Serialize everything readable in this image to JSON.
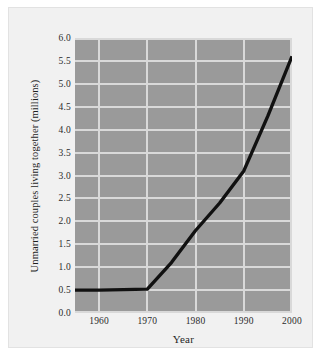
{
  "chart_data": {
    "type": "line",
    "title": "",
    "xlabel": "Year",
    "ylabel": "Unmarried couples living together (millions)",
    "xlim": [
      1955,
      2000
    ],
    "ylim": [
      0.0,
      6.0
    ],
    "grid": true,
    "legend": "none",
    "xticks": [
      1960,
      1970,
      1980,
      1990,
      2000
    ],
    "xtick_labels": [
      "1960",
      "1970",
      "1980",
      "1990",
      "2000"
    ],
    "yticks": [
      0.0,
      0.5,
      1.0,
      1.5,
      2.0,
      2.5,
      3.0,
      3.5,
      4.0,
      4.5,
      5.0,
      5.5,
      6.0
    ],
    "ytick_labels": [
      "0.0",
      "0.5",
      "1.0",
      "1.5",
      "2.0",
      "2.5",
      "3.0",
      "3.5",
      "4.0",
      "4.5",
      "5.0",
      "5.5",
      "6.0"
    ],
    "series": [
      {
        "name": "Unmarried couples living together",
        "color": "#111111",
        "x": [
          1955,
          1960,
          1970,
          1975,
          1980,
          1985,
          1990,
          1995,
          2000
        ],
        "values": [
          0.5,
          0.5,
          0.52,
          1.1,
          1.8,
          2.4,
          3.1,
          4.3,
          5.6
        ]
      }
    ]
  },
  "style": {
    "plot_background": "#9a9a9a",
    "grid_color": "#d9d9d9",
    "card_background": "#f1f1f1",
    "line_color": "#111111",
    "text_color": "#1f1f1f"
  }
}
